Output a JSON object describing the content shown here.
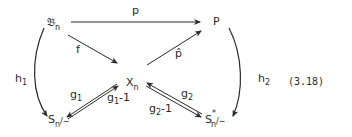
{
  "diagram": {
    "nodes": {
      "Bn": {
        "base": "𝔅",
        "sub": "n"
      },
      "P": {
        "base": "P"
      },
      "Xn": {
        "base": "X",
        "sub": "n"
      },
      "Sn_quot": {
        "base": "S",
        "sub": "n",
        "suffix": "/∼"
      },
      "Sn_star_quot": {
        "base": "S",
        "sub": "n",
        "sup": "*",
        "suffix": "/∼"
      }
    },
    "edges": {
      "p": {
        "label": "p",
        "from": "Bn",
        "to": "P"
      },
      "f": {
        "label": "f",
        "from": "Bn",
        "to": "Xn"
      },
      "p_hat": {
        "label": "p̂",
        "from": "Xn",
        "to": "P"
      },
      "h1": {
        "label_base": "h",
        "label_sub": "1",
        "from": "Bn",
        "to": "Sn_quot"
      },
      "h2": {
        "label_base": "h",
        "label_sub": "2",
        "from": "P",
        "to": "Sn_star_quot"
      },
      "g1": {
        "label_base": "g",
        "label_sub": "1",
        "from": "Xn",
        "to": "Sn_quot"
      },
      "g1_inv": {
        "label_base": "g",
        "label_sub": "1",
        "label_suffix": "-1",
        "from": "Sn_quot",
        "to": "Xn"
      },
      "g2": {
        "label_base": "g",
        "label_sub": "2",
        "from": "Sn_star_quot",
        "to": "Xn"
      },
      "g2_inv": {
        "label_base": "g",
        "label_sub": "2",
        "label_suffix": "-1",
        "from": "Xn",
        "to": "Sn_star_quot"
      }
    },
    "equation_number": "(3.18)"
  }
}
